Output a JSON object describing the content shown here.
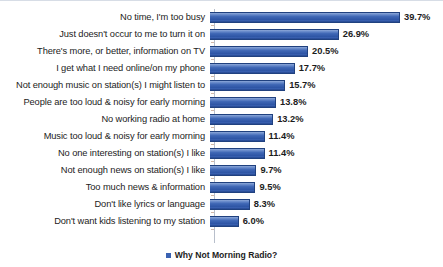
{
  "chart_data": {
    "type": "bar",
    "orientation": "horizontal",
    "title": "",
    "xlabel": "",
    "ylabel": "",
    "grid": false,
    "legend_position": "bottom",
    "xlim": [
      0,
      39.7
    ],
    "value_suffix": "%",
    "series": [
      {
        "name": "Why Not Morning Radio?",
        "color": "#3a62b2",
        "values": [
          39.7,
          26.9,
          20.5,
          17.7,
          15.7,
          13.8,
          13.2,
          11.4,
          11.4,
          9.7,
          9.5,
          8.3,
          6.0
        ]
      }
    ],
    "categories": [
      "No time, I'm too busy",
      "Just doesn't occur to me to turn it on",
      "There's more, or better, information on TV",
      "I get what I need online/on my phone",
      "Not enough music on station(s) I might listen to",
      "People are too loud & noisy for early morning",
      "No working radio at home",
      "Music too loud & noisy for early morning",
      "No one interesting on station(s) I like",
      "Not enough news on station(s) I like",
      "Too much news & information",
      "Don't like lyrics or language",
      "Don't want kids listening to my station"
    ],
    "data_labels": [
      "39.7%",
      "26.9%",
      "20.5%",
      "17.7%",
      "15.7%",
      "13.8%",
      "13.2%",
      "11.4%",
      "11.4%",
      "9.7%",
      "9.5%",
      "8.3%",
      "6.0%"
    ]
  },
  "legend": {
    "label": "Why Not Morning Radio?",
    "swatch_color": "#3a62b2"
  },
  "axis": {
    "line_color": "#b8bfcb"
  }
}
